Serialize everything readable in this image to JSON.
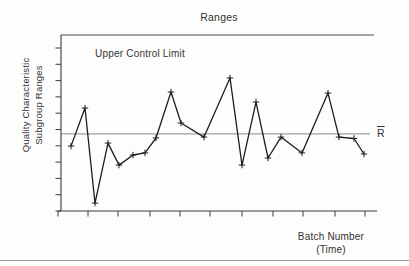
{
  "window": {
    "width": 409,
    "height": 266
  },
  "chart": {
    "title": "Ranges",
    "ucl_label": "Upper Control Limit",
    "rbar_label": "R",
    "ylabel_line1": "Quality Characteristic",
    "ylabel_line2": "Subgroup Ranges",
    "xlabel_line1": "Batch Number",
    "xlabel_line2": "(Time)"
  },
  "colors": {
    "background": "#fdfdfc",
    "text": "#333333",
    "axis": "#3a3a3a",
    "series": "#1e1e1e",
    "ucl_line": "#4a4a4a",
    "center_line": "#8a8a8a",
    "divider": "#9a9a9a"
  },
  "chart_data": {
    "type": "line",
    "title": "Ranges",
    "xlabel": "Batch Number (Time)",
    "ylabel": "Quality Characteristic Subgroup Ranges",
    "marker": "plus",
    "legend": "none",
    "grid": false,
    "axis_numeric_labels": false,
    "ylim": [
      0,
      100
    ],
    "upper_control_limit": 100,
    "center_line_rbar": 43.8,
    "x": [
      1,
      2,
      3,
      4,
      5,
      6,
      7,
      8,
      9,
      10,
      11,
      12,
      13,
      14,
      15,
      16,
      17,
      18,
      19,
      20,
      21
    ],
    "values": [
      36.9,
      58.5,
      4.5,
      38.6,
      26.1,
      31.8,
      33.0,
      41.5,
      67.6,
      50.0,
      42.0,
      75.6,
      26.1,
      61.9,
      30.1,
      42.0,
      33.0,
      67.0,
      42.0,
      41.2,
      32.4
    ],
    "layout_hints": {
      "plot": {
        "left": 61,
        "right": 377,
        "top": 35,
        "bottom": 211,
        "ucl_x2": 374,
        "center_x2": 370,
        "xaxis_x1": 58
      },
      "point_x_px": [
        71,
        85,
        95,
        108,
        119,
        133,
        145,
        156,
        171,
        181,
        204,
        230,
        242,
        256,
        268,
        281,
        302,
        328,
        339,
        354,
        364
      ],
      "x_ticks_px": [
        58,
        88,
        118,
        150,
        180,
        210,
        242,
        273,
        303,
        335,
        365
      ],
      "y_ticks_count": 11,
      "y_ticks_top_px": 48,
      "tick_length": 5.5
    }
  }
}
